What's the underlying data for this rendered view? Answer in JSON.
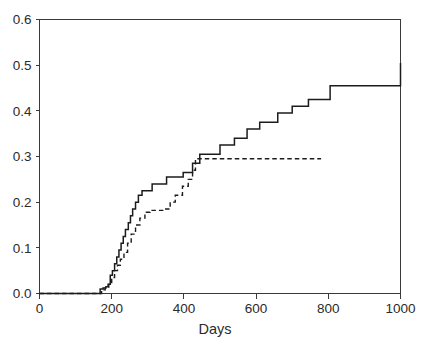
{
  "chart_data": {
    "type": "line",
    "subtype": "step-cumulative-incidence",
    "title": "",
    "subtitle": "",
    "xlabel": "Days",
    "ylabel": "",
    "xlim": [
      0,
      1000
    ],
    "ylim": [
      0.0,
      0.6
    ],
    "xticks": [
      0,
      200,
      400,
      600,
      800,
      1000
    ],
    "xtick_labels": [
      "0",
      "200",
      "400",
      "600",
      "800",
      "1000"
    ],
    "yticks": [
      0.0,
      0.1,
      0.2,
      0.3,
      0.4,
      0.5,
      0.6
    ],
    "ytick_labels": [
      "0.0",
      "0.1",
      "0.2",
      "0.3",
      "0.4",
      "0.5",
      "0.6"
    ],
    "grid": false,
    "legend": null,
    "legend_position": "none",
    "annotations": [],
    "series": [
      {
        "name": "solid-curve",
        "style": "solid",
        "color": "#1c1c1c",
        "step": "post",
        "x": [
          0,
          160,
          168,
          176,
          184,
          190,
          196,
          202,
          208,
          214,
          220,
          226,
          232,
          238,
          246,
          252,
          258,
          266,
          274,
          284,
          296,
          312,
          330,
          352,
          378,
          398,
          414,
          424,
          432,
          444,
          470,
          500,
          540,
          575,
          610,
          660,
          700,
          745,
          805,
          1000
        ],
        "y": [
          0.0,
          0.0,
          0.01,
          0.012,
          0.015,
          0.02,
          0.04,
          0.05,
          0.065,
          0.08,
          0.095,
          0.11,
          0.125,
          0.14,
          0.155,
          0.17,
          0.185,
          0.2,
          0.215,
          0.225,
          0.225,
          0.24,
          0.24,
          0.255,
          0.255,
          0.265,
          0.265,
          0.285,
          0.285,
          0.305,
          0.305,
          0.325,
          0.34,
          0.36,
          0.375,
          0.395,
          0.41,
          0.425,
          0.455,
          0.505
        ]
      },
      {
        "name": "dashed-curve",
        "style": "dashed",
        "color": "#1c1c1c",
        "step": "post",
        "x": [
          0,
          162,
          172,
          182,
          192,
          200,
          208,
          216,
          224,
          234,
          244,
          254,
          266,
          278,
          292,
          306,
          324,
          344,
          362,
          376,
          396,
          412,
          424,
          432,
          780
        ],
        "y": [
          0.0,
          0.0,
          0.008,
          0.012,
          0.02,
          0.035,
          0.05,
          0.062,
          0.075,
          0.09,
          0.11,
          0.13,
          0.15,
          0.165,
          0.178,
          0.182,
          0.182,
          0.185,
          0.2,
          0.215,
          0.235,
          0.25,
          0.27,
          0.295,
          0.295
        ]
      }
    ]
  },
  "axis": {
    "x_title": "Days"
  }
}
